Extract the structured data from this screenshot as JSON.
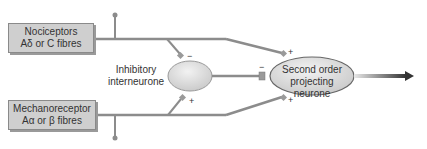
{
  "diagram": {
    "nodes": {
      "nociceptors": {
        "line1": "Nociceptors",
        "line2": "Aδ or C fibres"
      },
      "mechanoreceptor": {
        "line1": "Mechanoreceptor",
        "line2": "Aα or β fibres"
      },
      "inhibitory": {
        "line1": "Inhibitory",
        "line2": "interneurone"
      },
      "second_order": {
        "line1": "Second order",
        "line2": "projecting neurone"
      }
    },
    "synapse_signs": {
      "noci_to_inhib": "−",
      "mech_to_inhib": "+",
      "noci_to_second": "+",
      "mech_to_second": "+",
      "inhib_to_second": "−"
    },
    "colors": {
      "box_fill": "#cfcfcf",
      "ellipse_fill": "#d9d9d9",
      "line": "#8c8c8c",
      "arrow": "#333333"
    }
  }
}
